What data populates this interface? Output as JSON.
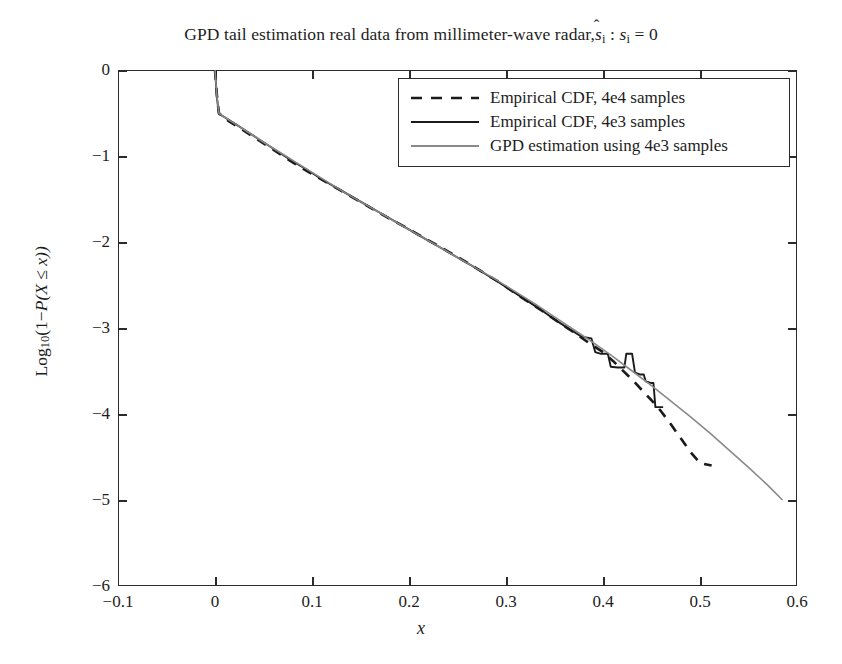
{
  "chart_data": {
    "type": "line",
    "title_plain": "GPD tail estimation real data from millimeter-wave radar, ŝi : si = 0",
    "title_parts": {
      "lead": "GPD tail estimation real data from millimeter-wave radar,",
      "shat": "s",
      "shat_sub": "i",
      "colon": ":",
      "s2": "s",
      "s2_sub": "i",
      "equals": "= 0"
    },
    "xlabel": "x",
    "ylabel_parts": {
      "log": "Log",
      "log_sub": "10",
      "open": "(1−",
      "p": "P",
      "inner": "(X ≤ x))"
    },
    "ylabel_plain": "Log10(1−P (X ≤ x))",
    "xlim": [
      -0.1,
      0.6
    ],
    "ylim": [
      -6,
      0
    ],
    "xticks": [
      -0.1,
      0,
      0.1,
      0.2,
      0.3,
      0.4,
      0.5,
      0.6
    ],
    "xtick_labels": [
      "−0.1",
      "0",
      "0.1",
      "0.2",
      "0.3",
      "0.4",
      "0.5",
      "0.6"
    ],
    "yticks": [
      0,
      -1,
      -2,
      -3,
      -4,
      -5,
      -6
    ],
    "ytick_labels": [
      "0",
      "−1",
      "−2",
      "−3",
      "−4",
      "−5",
      "−6"
    ],
    "grid": false,
    "legend_position": "upper right",
    "legend": [
      {
        "label": "Empirical CDF, 4e4 samples",
        "style": "dashed",
        "color": "#1a1a1a",
        "width": 2.4
      },
      {
        "label": "Empirical CDF, 4e3 samples",
        "style": "solid",
        "color": "#1a1a1a",
        "width": 1.8
      },
      {
        "label": "GPD estimation using 4e3 samples",
        "style": "solid",
        "color": "#8a8a8a",
        "width": 1.5
      }
    ],
    "series": [
      {
        "name": "Empirical CDF, 4e4 samples",
        "style": "dashed",
        "color": "#1a1a1a",
        "points": [
          [
            0.0,
            0.0
          ],
          [
            0.002,
            -0.3
          ],
          [
            0.004,
            -0.5
          ],
          [
            0.008,
            -0.54
          ],
          [
            0.015,
            -0.6
          ],
          [
            0.025,
            -0.67
          ],
          [
            0.04,
            -0.78
          ],
          [
            0.055,
            -0.89
          ],
          [
            0.07,
            -1.0
          ],
          [
            0.085,
            -1.11
          ],
          [
            0.1,
            -1.21
          ],
          [
            0.12,
            -1.34
          ],
          [
            0.14,
            -1.47
          ],
          [
            0.16,
            -1.6
          ],
          [
            0.18,
            -1.73
          ],
          [
            0.2,
            -1.85
          ],
          [
            0.22,
            -1.98
          ],
          [
            0.24,
            -2.11
          ],
          [
            0.26,
            -2.24
          ],
          [
            0.28,
            -2.38
          ],
          [
            0.295,
            -2.48
          ],
          [
            0.31,
            -2.6
          ],
          [
            0.325,
            -2.71
          ],
          [
            0.34,
            -2.82
          ],
          [
            0.355,
            -2.94
          ],
          [
            0.37,
            -3.05
          ],
          [
            0.385,
            -3.17
          ],
          [
            0.4,
            -3.28
          ],
          [
            0.41,
            -3.38
          ],
          [
            0.42,
            -3.49
          ],
          [
            0.43,
            -3.6
          ],
          [
            0.44,
            -3.72
          ],
          [
            0.45,
            -3.84
          ],
          [
            0.46,
            -3.97
          ],
          [
            0.47,
            -4.12
          ],
          [
            0.48,
            -4.28
          ],
          [
            0.49,
            -4.44
          ],
          [
            0.5,
            -4.57
          ],
          [
            0.512,
            -4.6
          ]
        ]
      },
      {
        "name": "Empirical CDF, 4e3 samples",
        "style": "solid-step",
        "color": "#1a1a1a",
        "points": [
          [
            0.0,
            0.0
          ],
          [
            0.002,
            -0.32
          ],
          [
            0.004,
            -0.51
          ],
          [
            0.01,
            -0.55
          ],
          [
            0.02,
            -0.62
          ],
          [
            0.035,
            -0.73
          ],
          [
            0.05,
            -0.84
          ],
          [
            0.065,
            -0.95
          ],
          [
            0.08,
            -1.06
          ],
          [
            0.095,
            -1.16
          ],
          [
            0.11,
            -1.27
          ],
          [
            0.13,
            -1.4
          ],
          [
            0.15,
            -1.53
          ],
          [
            0.17,
            -1.66
          ],
          [
            0.19,
            -1.79
          ],
          [
            0.21,
            -1.92
          ],
          [
            0.23,
            -2.05
          ],
          [
            0.25,
            -2.18
          ],
          [
            0.27,
            -2.31
          ],
          [
            0.29,
            -2.45
          ],
          [
            0.305,
            -2.56
          ],
          [
            0.32,
            -2.67
          ],
          [
            0.335,
            -2.78
          ],
          [
            0.35,
            -2.9
          ],
          [
            0.365,
            -3.01
          ],
          [
            0.378,
            -3.1
          ],
          [
            0.388,
            -3.12
          ],
          [
            0.392,
            -3.28
          ],
          [
            0.398,
            -3.3
          ],
          [
            0.405,
            -3.3
          ],
          [
            0.408,
            -3.45
          ],
          [
            0.415,
            -3.46
          ],
          [
            0.422,
            -3.46
          ],
          [
            0.424,
            -3.3
          ],
          [
            0.43,
            -3.3
          ],
          [
            0.433,
            -3.52
          ],
          [
            0.438,
            -3.54
          ],
          [
            0.442,
            -3.54
          ],
          [
            0.444,
            -3.62
          ],
          [
            0.45,
            -3.64
          ],
          [
            0.452,
            -3.64
          ],
          [
            0.454,
            -3.92
          ],
          [
            0.462,
            -3.92
          ]
        ]
      },
      {
        "name": "GPD estimation using 4e3 samples",
        "style": "solid",
        "color": "#8a8a8a",
        "points": [
          [
            0.0,
            0.0
          ],
          [
            0.002,
            -0.31
          ],
          [
            0.004,
            -0.5
          ],
          [
            0.01,
            -0.55
          ],
          [
            0.02,
            -0.62
          ],
          [
            0.035,
            -0.73
          ],
          [
            0.05,
            -0.84
          ],
          [
            0.07,
            -0.98
          ],
          [
            0.09,
            -1.12
          ],
          [
            0.11,
            -1.26
          ],
          [
            0.13,
            -1.4
          ],
          [
            0.15,
            -1.53
          ],
          [
            0.17,
            -1.66
          ],
          [
            0.19,
            -1.79
          ],
          [
            0.21,
            -1.92
          ],
          [
            0.23,
            -2.05
          ],
          [
            0.25,
            -2.18
          ],
          [
            0.27,
            -2.31
          ],
          [
            0.29,
            -2.44
          ],
          [
            0.31,
            -2.58
          ],
          [
            0.33,
            -2.72
          ],
          [
            0.35,
            -2.87
          ],
          [
            0.37,
            -3.02
          ],
          [
            0.39,
            -3.17
          ],
          [
            0.41,
            -3.33
          ],
          [
            0.43,
            -3.5
          ],
          [
            0.45,
            -3.67
          ],
          [
            0.47,
            -3.85
          ],
          [
            0.49,
            -4.03
          ],
          [
            0.51,
            -4.22
          ],
          [
            0.53,
            -4.42
          ],
          [
            0.55,
            -4.62
          ],
          [
            0.57,
            -4.83
          ],
          [
            0.585,
            -5.0
          ]
        ]
      }
    ]
  }
}
